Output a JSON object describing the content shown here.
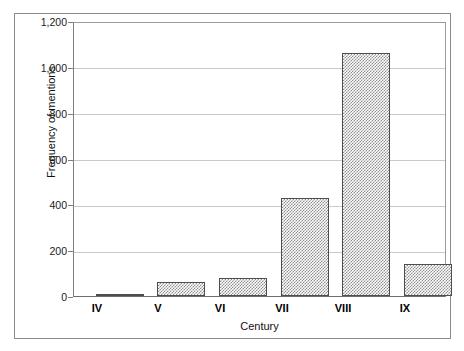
{
  "chart_data": {
    "type": "bar",
    "title": "",
    "subtitle": "",
    "xlabel": "Century",
    "ylabel": "Frequency of mentions",
    "categories": [
      "IV",
      "V",
      "VI",
      "VII",
      "VIII",
      "IX"
    ],
    "values": [
      8,
      61,
      78,
      428,
      1060,
      140
    ],
    "series": [
      {
        "name": "Frequency of mentions",
        "values": [
          8,
          61,
          78,
          428,
          1060,
          140
        ]
      }
    ],
    "ylim": [
      0,
      1200
    ],
    "ytick_values": [
      0,
      200,
      400,
      600,
      800,
      1000,
      1200
    ],
    "ytick_labels": [
      "0",
      "200",
      "400",
      "600",
      "800",
      "1,000",
      "1,200"
    ],
    "grid": "horizontal",
    "legend": "none",
    "bar_fill": "#8f8f8f",
    "bar_fill_style": "checkerboard-hatch",
    "bar_border_color": "#4d4d4d",
    "gridline_color": "#c9c9c9",
    "axis_color": "#7d7d7d",
    "frame_color": "#8a8a8a",
    "background_color": "#ffffff",
    "text_color": "#111111"
  }
}
